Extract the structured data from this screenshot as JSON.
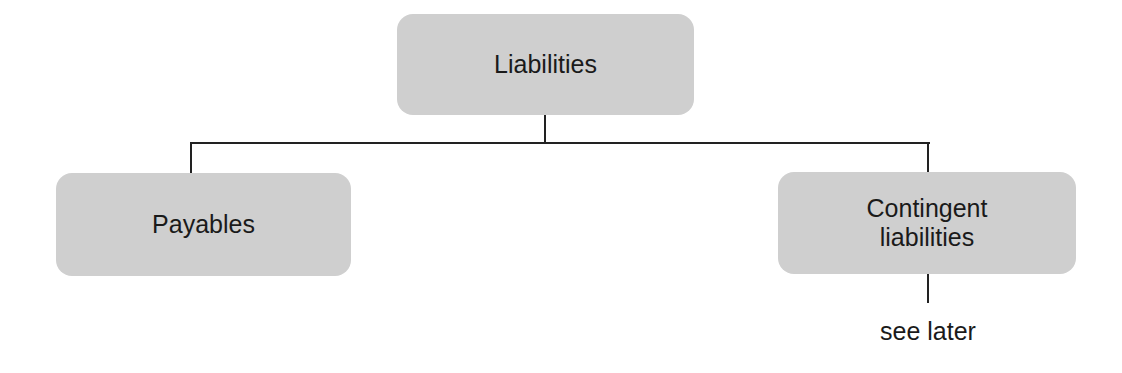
{
  "diagram": {
    "type": "tree",
    "root": {
      "label": "Liabilities"
    },
    "children": [
      {
        "label": "Payables"
      },
      {
        "label": "Contingent liabilities",
        "note": "see later"
      }
    ],
    "colors": {
      "node_fill": "#cfcfcf",
      "line": "#222222",
      "text": "#1a1a1a"
    }
  }
}
